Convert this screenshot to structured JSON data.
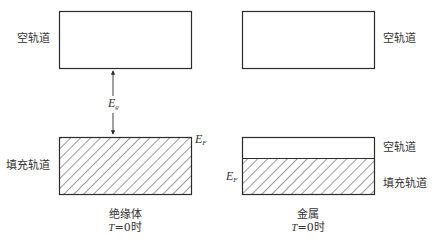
{
  "insulator": {
    "upper_band_label": "空轨道",
    "lower_band_label": "填充轨道",
    "gap_label": {
      "main": "E",
      "sub": "g"
    },
    "fermi_label": {
      "main": "E",
      "sub": "F"
    },
    "caption_line1": "绝缘体",
    "caption_T": "T",
    "caption_rest": "=0时"
  },
  "metal": {
    "upper_band_label": "空轨道",
    "partial_empty_label": "空轨道",
    "partial_filled_label": "填充轨道",
    "fermi_label": {
      "main": "E",
      "sub": "F"
    },
    "caption_line1": "金属",
    "caption_T": "T",
    "caption_rest": "=0时"
  },
  "colors": {
    "stroke": "#2b2b2b",
    "hatch": "#3a3a3a",
    "background": "#ffffff"
  }
}
